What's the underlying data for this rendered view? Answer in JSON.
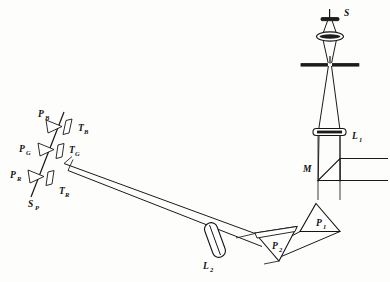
{
  "figure": {
    "background_color": "#fdfdfc",
    "ink_color": "#141414",
    "width": 390,
    "height": 282
  },
  "labels": {
    "source": {
      "text": "S",
      "sub": "",
      "x": 340,
      "y": 14
    },
    "lens_1": {
      "text": "L",
      "sub": "1",
      "x": 352,
      "y": 139
    },
    "mirror": {
      "text": "M",
      "sub": "",
      "x": 305,
      "y": 168
    },
    "prism_1": {
      "text": "P",
      "sub": "1",
      "x": 320,
      "y": 224
    },
    "prism_2": {
      "text": "P",
      "sub": "2",
      "x": 276,
      "y": 247
    },
    "lens_2": {
      "text": "L",
      "sub": "2",
      "x": 206,
      "y": 266
    },
    "photocell_blue": {
      "text": "P",
      "sub": "B",
      "x": 40,
      "y": 114
    },
    "photocell_green": {
      "text": "P",
      "sub": "G",
      "x": 22,
      "y": 150
    },
    "photocell_red": {
      "text": "P",
      "sub": "R",
      "x": 20,
      "y": 174
    },
    "tube_blue": {
      "text": "T",
      "sub": "B",
      "x": 74,
      "y": 128
    },
    "tube_green": {
      "text": "T",
      "sub": "G",
      "x": 64,
      "y": 153
    },
    "tube_red": {
      "text": "T",
      "sub": "R",
      "x": 46,
      "y": 192
    },
    "slit_plate": {
      "text": "S",
      "sub": "P",
      "x": 30,
      "y": 204
    }
  },
  "components": [
    {
      "name": "light-source",
      "type": "lamp-filament",
      "label": "S"
    },
    {
      "name": "condenser-lens",
      "type": "lens",
      "label": ""
    },
    {
      "name": "aperture-stop",
      "type": "slit",
      "label": ""
    },
    {
      "name": "collimating-lens-1",
      "type": "lens",
      "label": "L1"
    },
    {
      "name": "mirror-prism",
      "type": "right-angle-prism",
      "label": "M"
    },
    {
      "name": "dispersing-prism-1",
      "type": "triangular-prism",
      "label": "P1"
    },
    {
      "name": "dispersing-prism-2",
      "type": "triangular-prism",
      "label": "P2"
    },
    {
      "name": "focusing-lens-2",
      "type": "lens",
      "label": "L2"
    },
    {
      "name": "exit-slit-plate",
      "type": "slit-plate",
      "label": "SP"
    },
    {
      "name": "phototube-blue",
      "type": "phototube",
      "label": "TB"
    },
    {
      "name": "phototube-green",
      "type": "phototube",
      "label": "TG"
    },
    {
      "name": "phototube-red",
      "type": "phototube",
      "label": "TR"
    },
    {
      "name": "photocell-blue",
      "type": "photocell",
      "label": "PB"
    },
    {
      "name": "photocell-green",
      "type": "photocell",
      "label": "PG"
    },
    {
      "name": "photocell-red",
      "type": "photocell",
      "label": "PR"
    }
  ]
}
